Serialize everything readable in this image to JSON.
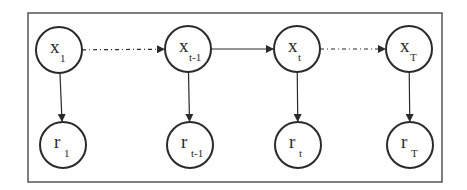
{
  "diagram": {
    "type": "dynamic-bayesian-network",
    "frame": {
      "x": 28,
      "y": 13,
      "width": 414,
      "height": 169
    },
    "colors": {
      "stroke": "#2a2a2a",
      "frame": "#555555",
      "background": "#ffffff"
    },
    "nodes": [
      {
        "id": "x1",
        "main": "x",
        "sub": "1",
        "cx": 59,
        "cy": 50,
        "r": 23
      },
      {
        "id": "xt-1",
        "main": "x",
        "sub": "t-1",
        "cx": 188,
        "cy": 49,
        "r": 23
      },
      {
        "id": "xt",
        "main": "x",
        "sub": "t",
        "cx": 297,
        "cy": 49,
        "r": 23
      },
      {
        "id": "xT",
        "main": "x",
        "sub": "T",
        "cx": 409,
        "cy": 49,
        "r": 23
      },
      {
        "id": "r1",
        "main": "r",
        "sub": "1",
        "cx": 63,
        "cy": 145,
        "r": 23
      },
      {
        "id": "rt-1",
        "main": "r",
        "sub": "t-1",
        "cx": 190,
        "cy": 145,
        "r": 23
      },
      {
        "id": "rt",
        "main": "r",
        "sub": "t",
        "cx": 298,
        "cy": 145,
        "r": 23
      },
      {
        "id": "rT",
        "main": "r",
        "sub": "T",
        "cx": 410,
        "cy": 145,
        "r": 23
      }
    ],
    "edges": [
      {
        "from": "x1",
        "to": "xt-1",
        "style": "dash-dot"
      },
      {
        "from": "xt-1",
        "to": "xt",
        "style": "solid"
      },
      {
        "from": "xt",
        "to": "xT",
        "style": "dash-dot"
      },
      {
        "from": "x1",
        "to": "r1",
        "style": "solid"
      },
      {
        "from": "xt-1",
        "to": "rt-1",
        "style": "solid"
      },
      {
        "from": "xt",
        "to": "rt",
        "style": "solid"
      },
      {
        "from": "xT",
        "to": "rT",
        "style": "solid"
      }
    ]
  }
}
